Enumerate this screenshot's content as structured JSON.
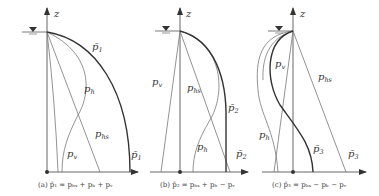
{
  "figure": {
    "axis_label": "z",
    "panels": [
      {
        "id": "a",
        "caption": "(a) p̄₁ = pₕₛ + pₕ + pᵥ",
        "labels": {
          "total": "p̄",
          "total_sub": "1",
          "ph": "p",
          "ph_sub": "h",
          "phs": "p",
          "phs_sub": "hs",
          "pv": "p",
          "pv_sub": "v",
          "total_bottom": "p̄",
          "total_bottom_sub": "1"
        }
      },
      {
        "id": "b",
        "caption": "(b) p̄₂ = pₕₛ + pₕ − pᵥ",
        "labels": {
          "pv": "p",
          "pv_sub": "v",
          "phs": "p",
          "phs_sub": "hs",
          "total": "p̄",
          "total_sub": "2",
          "ph": "p",
          "ph_sub": "h",
          "total_bottom": "p̄",
          "total_bottom_sub": "2"
        }
      },
      {
        "id": "c",
        "caption": "(c) p̄₃ = pₕₛ − pₕ − pᵥ",
        "labels": {
          "pv": "p",
          "pv_sub": "v",
          "phs": "p",
          "phs_sub": "hs",
          "ph": "p",
          "ph_sub": "h",
          "total": "p̄",
          "total_sub": "3",
          "total_bottom": "p̄",
          "total_bottom_sub": "3"
        }
      }
    ]
  }
}
